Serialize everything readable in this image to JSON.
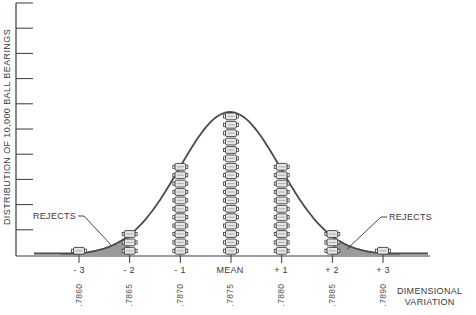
{
  "chart_data": {
    "type": "bar",
    "title": "",
    "ylabel": "DISTRIBUTION OF 10,000 BALL BEARINGS",
    "xlabel": "DIMENSIONAL VARIATION",
    "categories": [
      "- 3",
      "- 2",
      "- 1",
      "MEAN",
      "+ 1",
      "+ 2",
      "+ 3"
    ],
    "dimension_values": [
      ".7860",
      ".7865",
      ".7870",
      ".7875",
      ".7880",
      ".7885",
      ".7890"
    ],
    "series": [
      {
        "name": "Ball bearings stacked (count of icons)",
        "values": [
          1,
          3,
          11,
          17,
          11,
          3,
          1
        ]
      }
    ],
    "overlay": "normal distribution bell curve",
    "annotations": [
      {
        "text": "REJECTS",
        "position": "left tail (beyond -2)"
      },
      {
        "text": "REJECTS",
        "position": "right tail (beyond +2)"
      }
    ],
    "y_ticks": 10,
    "grid": false,
    "legend": "none"
  },
  "labels": {
    "ylabel": "DISTRIBUTION OF 10,000 BALL BEARINGS",
    "xlabel_line1": "DIMENSIONAL",
    "xlabel_line2": "VARIATION",
    "rejects_left": "REJECTS",
    "rejects_right": "REJECTS",
    "sigma": [
      "- 3",
      "- 2",
      "- 1",
      "MEAN",
      "+ 1",
      "+ 2",
      "+ 3"
    ],
    "values": [
      ".7860",
      ".7865",
      ".7870",
      ".7875",
      ".7880",
      ".7885",
      ".7890"
    ]
  },
  "colors": {
    "line": "#4a4a4a",
    "reject_fill": "#9a9a9a",
    "bearing_fill": "#e6e6e6",
    "bearing_stroke": "#3c3c3c"
  }
}
